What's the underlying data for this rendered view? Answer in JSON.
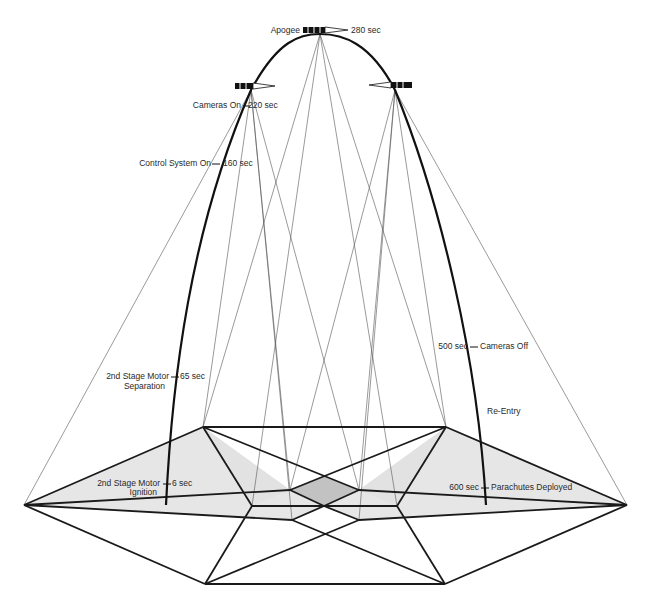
{
  "diagram": {
    "type": "sounding-rocket-flight-profile",
    "colors": {
      "line": "#1a1a1a",
      "thin_ray": "#555555",
      "coverage_fill": "#e4e4e4",
      "overlap_fill": "#c4c4c4",
      "background": "#ffffff"
    },
    "labels": {
      "apogee": "Apogee",
      "apogee_time": "280 sec",
      "cameras_on": "Cameras On",
      "cameras_on_time": "220 sec",
      "control_system_on": "Control System On",
      "control_system_on_time": "160 sec",
      "separation_line1": "2nd Stage Motor",
      "separation_line2": "Separation",
      "separation_time": "65 sec",
      "ignition_line1": "2nd Stage Motor",
      "ignition_line2": "Ignition",
      "ignition_time": "6 sec",
      "cameras_off_time": "500 sec",
      "cameras_off": "Cameras Off",
      "re_entry": "Re-Entry",
      "parachutes_time": "600 sec",
      "parachutes": "Parachutes Deployed"
    },
    "events": [
      {
        "time_sec": 6,
        "event": "2nd Stage Motor Ignition"
      },
      {
        "time_sec": 65,
        "event": "2nd Stage Motor Separation"
      },
      {
        "time_sec": 160,
        "event": "Control System On"
      },
      {
        "time_sec": 220,
        "event": "Cameras On"
      },
      {
        "time_sec": 280,
        "event": "Apogee"
      },
      {
        "time_sec": 500,
        "event": "Cameras Off"
      },
      {
        "time_sec": 600,
        "event": "Parachutes Deployed"
      }
    ],
    "icons": [
      "payload-satellite-icon",
      "camera-view-cone-icon"
    ]
  }
}
